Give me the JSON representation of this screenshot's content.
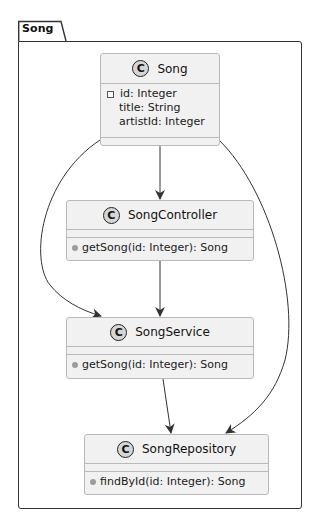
{
  "package": {
    "name": "Song"
  },
  "classes": [
    {
      "id": "song",
      "name": "Song",
      "stereotype_icon": "C",
      "attributes": [
        {
          "visibility": "private",
          "text": "id: Integer"
        },
        {
          "visibility": "none",
          "text": "title: String"
        },
        {
          "visibility": "none",
          "text": "artistId: Integer"
        }
      ],
      "methods": []
    },
    {
      "id": "songcontroller",
      "name": "SongController",
      "stereotype_icon": "C",
      "attributes": [],
      "methods": [
        {
          "visibility": "public",
          "text": "getSong(id: Integer): Song"
        }
      ]
    },
    {
      "id": "songservice",
      "name": "SongService",
      "stereotype_icon": "C",
      "attributes": [],
      "methods": [
        {
          "visibility": "public",
          "text": "getSong(id: Integer): Song"
        }
      ]
    },
    {
      "id": "songrepository",
      "name": "SongRepository",
      "stereotype_icon": "C",
      "attributes": [],
      "methods": [
        {
          "visibility": "public",
          "text": "findById(id: Integer): Song"
        }
      ]
    }
  ],
  "relations": [
    {
      "from": "Song",
      "to": "SongController",
      "type": "directed-association"
    },
    {
      "from": "Song",
      "to": "SongService",
      "type": "directed-association"
    },
    {
      "from": "Song",
      "to": "SongRepository",
      "type": "directed-association"
    },
    {
      "from": "SongController",
      "to": "SongService",
      "type": "directed-association"
    },
    {
      "from": "SongService",
      "to": "SongRepository",
      "type": "directed-association"
    }
  ],
  "colors": {
    "class_fill": "#f1f1f1",
    "class_border": "#b9b9b9",
    "frame_border": "#333333",
    "arrow": "#333333",
    "class_badge": "#d6d6d6"
  }
}
